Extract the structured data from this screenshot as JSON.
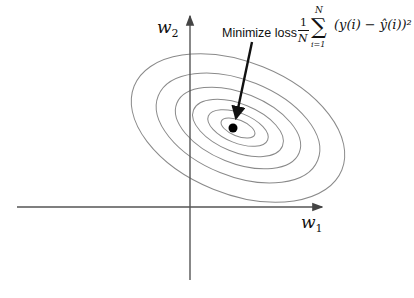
{
  "diagram": {
    "type": "loss-contour",
    "axes": {
      "x_label": "w",
      "x_sub": "1",
      "y_label": "w",
      "y_sub": "2"
    },
    "annotation": {
      "text": "Minimize loss",
      "formula_frac_num": "1",
      "formula_frac_den": "N",
      "formula_sum_top": "N",
      "formula_sum_bottom": "i=1",
      "formula_body": "(y(i) − ŷ(i))²"
    },
    "contours": 6,
    "colors": {
      "contour": "#8a8a8a",
      "axis": "#555555",
      "arrow": "#111111",
      "minimum": "#000000"
    }
  }
}
